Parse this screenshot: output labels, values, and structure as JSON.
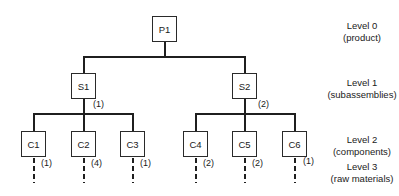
{
  "diagram": {
    "type": "product-structure-tree",
    "nodes": [
      {
        "id": "P1",
        "label": "P1",
        "level": 0,
        "parent": null,
        "quantity": null
      },
      {
        "id": "S1",
        "label": "S1",
        "level": 1,
        "parent": "P1",
        "quantity": "(1)"
      },
      {
        "id": "S2",
        "label": "S2",
        "level": 1,
        "parent": "P1",
        "quantity": "(2)"
      },
      {
        "id": "C1",
        "label": "C1",
        "level": 2,
        "parent": "S1",
        "quantity": "(1)"
      },
      {
        "id": "C2",
        "label": "C2",
        "level": 2,
        "parent": "S1",
        "quantity": "(4)"
      },
      {
        "id": "C3",
        "label": "C3",
        "level": 2,
        "parent": "S1",
        "quantity": "(1)"
      },
      {
        "id": "C4",
        "label": "C4",
        "level": 2,
        "parent": "S2",
        "quantity": "(2)"
      },
      {
        "id": "C5",
        "label": "C5",
        "level": 2,
        "parent": "S2",
        "quantity": "(2)"
      },
      {
        "id": "C6",
        "label": "C6",
        "level": 2,
        "parent": "S2",
        "quantity": "(1)"
      }
    ],
    "levels": [
      {
        "title": "Level 0",
        "subtitle": "(product)"
      },
      {
        "title": "Level 1",
        "subtitle": "(subassemblies)"
      },
      {
        "title": "Level 2",
        "subtitle": "(components)"
      },
      {
        "title": "Level 3",
        "subtitle": "(raw materials)"
      }
    ],
    "raw_material_quantities": [
      "(1)",
      "(4)",
      "(1)",
      "(2)",
      "(2)",
      "(1)"
    ]
  }
}
